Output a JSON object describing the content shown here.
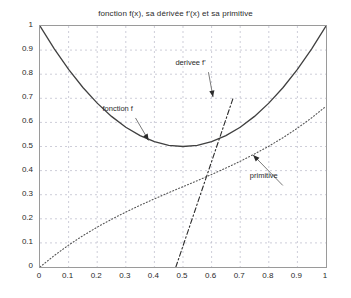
{
  "chart_data": {
    "type": "line",
    "title": "fonction f(x), sa dérivée f'(x) et sa primitive",
    "xlabel": "",
    "ylabel": "",
    "xlim": [
      0,
      1
    ],
    "ylim": [
      0,
      1
    ],
    "grid": true,
    "grid_style": "dashed",
    "legend_position": "inline-annotations",
    "xticks": [
      "0",
      "0.1",
      "0.2",
      "0.3",
      "0.4",
      "0.5",
      "0.6",
      "0.7",
      "0.8",
      "0.9",
      "1"
    ],
    "xtick_values": [
      0,
      0.1,
      0.2,
      0.3,
      0.4,
      0.5,
      0.6,
      0.7,
      0.8,
      0.9,
      1
    ],
    "yticks": [
      "0",
      "0.1",
      "0.2",
      "0.3",
      "0.4",
      "0.5",
      "0.6",
      "0.7",
      "0.8",
      "0.9",
      "1"
    ],
    "ytick_values": [
      0,
      0.1,
      0.2,
      0.3,
      0.4,
      0.5,
      0.6,
      0.7,
      0.8,
      0.9,
      1
    ],
    "x": [
      0,
      0.05,
      0.1,
      0.15,
      0.2,
      0.25,
      0.3,
      0.35,
      0.4,
      0.45,
      0.5,
      0.55,
      0.6,
      0.65,
      0.7,
      0.75,
      0.8,
      0.85,
      0.9,
      0.95,
      1
    ],
    "series": [
      {
        "name": "fonction f",
        "formula": "f(x) = 1 - 2x + 2x^2",
        "style": "solid",
        "color": "#404040",
        "values": [
          1,
          0.905,
          0.82,
          0.745,
          0.68,
          0.625,
          0.58,
          0.545,
          0.52,
          0.505,
          0.5,
          0.505,
          0.52,
          0.545,
          0.58,
          0.625,
          0.68,
          0.745,
          0.82,
          0.905,
          1
        ]
      },
      {
        "name": "derivee f'",
        "formula": "f'(x) = -2 + 4x",
        "style": "dash-dot",
        "color": "#2b2b2b",
        "values": [
          -2,
          -1.8,
          -1.6,
          -1.4,
          -1.2,
          -1,
          -0.8,
          -0.6,
          -0.4,
          -0.2,
          0,
          0.2,
          0.4,
          0.6,
          0.8,
          1,
          1.2,
          1.4,
          1.6,
          1.8,
          2
        ],
        "visible_range_x": [
          0.475,
          0.675
        ],
        "note": "only the portion with 0 <= f'(x) <= 1 is inside the axes"
      },
      {
        "name": "primitive",
        "formula": "F(x) = x - x^2 + (2/3)x^3",
        "style": "dotted",
        "color": "#555555",
        "values": [
          0,
          0.0476,
          0.0907,
          0.1298,
          0.1653,
          0.1979,
          0.228,
          0.2561,
          0.2827,
          0.3084,
          0.3333,
          0.3581,
          0.384,
          0.4106,
          0.4387,
          0.4688,
          0.5013,
          0.5369,
          0.576,
          0.6191,
          0.6667
        ]
      }
    ],
    "annotations": [
      {
        "label": "fonction f",
        "text_x": 0.285,
        "text_y": 0.635,
        "arrow_to_x": 0.38,
        "arrow_to_y": 0.525
      },
      {
        "label": "derivee f'",
        "text_x": 0.54,
        "text_y": 0.825,
        "arrow_to_x": 0.605,
        "arrow_to_y": 0.705
      },
      {
        "label": "primitive",
        "text_x": 0.8,
        "text_y": 0.355,
        "arrow_to_x": 0.745,
        "arrow_to_y": 0.465
      }
    ],
    "colors": {
      "axis": "#9a9a9a",
      "grid": "#b9b9c9",
      "text": "#2b2b2b",
      "background": "#ffffff"
    }
  }
}
